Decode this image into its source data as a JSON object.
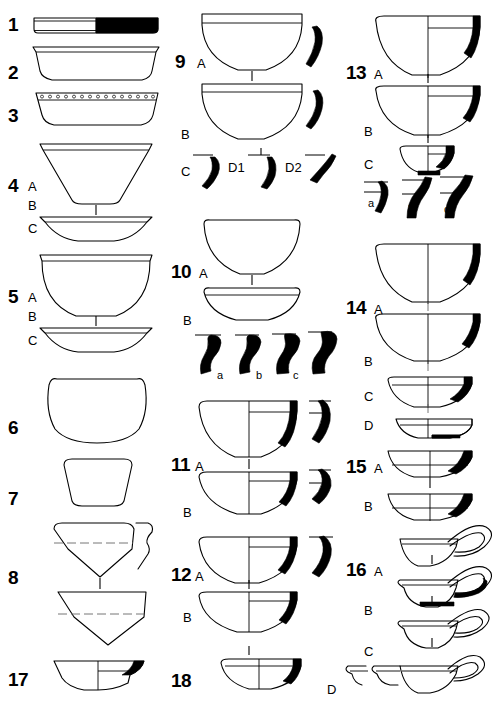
{
  "plate": {
    "title": "Pottery typology plate",
    "description": "Archaeological line-drawing plate of ceramic vessel profiles arranged in three columns, numbered 1 to 18 with lettered variants.",
    "background_color": "#ffffff",
    "ink_color": "#000000",
    "fill_color": "#000000"
  },
  "columns": [
    {
      "name": "column-left",
      "figures": [
        {
          "id": "fig-1",
          "number": "1",
          "variants": [],
          "form": "flat-disk",
          "note": "flat plate profile, right half solid black"
        },
        {
          "id": "fig-2",
          "number": "2",
          "variants": [],
          "form": "shallow-bowl",
          "note": "shallow open bowl with flat rim band"
        },
        {
          "id": "fig-3",
          "number": "3",
          "variants": [],
          "form": "shallow-bowl-dotted",
          "note": "shallow bowl with row of punctate dots below rim"
        },
        {
          "id": "fig-4",
          "number": "4",
          "variants": [
            "A",
            "B",
            "C"
          ],
          "form": "conical-bowl",
          "note": "deep conical bowl A over shallow bowl C"
        },
        {
          "id": "fig-5",
          "number": "5",
          "variants": [
            "A",
            "B",
            "C"
          ],
          "form": "hemispherical-bowl",
          "note": "hemispherical bowl A over shallow bowl C"
        },
        {
          "id": "fig-6",
          "number": "6",
          "variants": [],
          "form": "globular-jar",
          "note": "closed globular vessel"
        },
        {
          "id": "fig-7",
          "number": "7",
          "variants": [],
          "form": "small-cup",
          "note": "small straight-sided cup"
        },
        {
          "id": "fig-8",
          "number": "8",
          "variants": [],
          "form": "carinated-bowl",
          "note": "two carinated bowls with dashed carination line and rim sherd"
        },
        {
          "id": "fig-17",
          "number": "17",
          "variants": [],
          "form": "shallow-bowl-section",
          "note": "half-section bowl with black rim"
        }
      ]
    },
    {
      "name": "column-middle",
      "figures": [
        {
          "id": "fig-9",
          "number": "9",
          "variants": [
            "A",
            "B",
            "C",
            "D1",
            "D2"
          ],
          "form": "deep-bowl",
          "note": "two deep bowls with rim band plus three black rim sherds"
        },
        {
          "id": "fig-10",
          "number": "10",
          "variants": [
            "A",
            "B",
            "a",
            "b",
            "c"
          ],
          "form": "deep-bowl",
          "note": "deep bowl A, shallow bowl B, four black rim profiles a b c"
        },
        {
          "id": "fig-11",
          "number": "11",
          "variants": [
            "A",
            "B"
          ],
          "form": "half-section-bowl",
          "note": "half-section bowls with black rim wedge and separate sherds"
        },
        {
          "id": "fig-12",
          "number": "12",
          "variants": [
            "A",
            "B"
          ],
          "form": "half-section-bowl",
          "note": "half-section bowls with black rim wedge and separate sherds"
        },
        {
          "id": "fig-18",
          "number": "18",
          "variants": [],
          "form": "shallow-half-section",
          "note": "shallow half-section bowl with black rim"
        }
      ]
    },
    {
      "name": "column-right",
      "figures": [
        {
          "id": "fig-13",
          "number": "13",
          "variants": [
            "A",
            "B",
            "C",
            "a",
            "b",
            "c"
          ],
          "form": "half-section-bowl",
          "note": "three nested bowls plus three black rim sherds"
        },
        {
          "id": "fig-14",
          "number": "14",
          "variants": [
            "A",
            "B",
            "C",
            "D"
          ],
          "form": "half-section-bowl",
          "note": "four nested bowls of decreasing depth"
        },
        {
          "id": "fig-15",
          "number": "15",
          "variants": [
            "A",
            "B"
          ],
          "form": "shallow-half-section",
          "note": "two shallow half-section bowls"
        },
        {
          "id": "fig-16",
          "number": "16",
          "variants": [
            "A",
            "B",
            "C",
            "D"
          ],
          "form": "handled-lamp",
          "note": "four bowls with large loop handles; D row has two partial profiles"
        }
      ]
    }
  ],
  "labels": {
    "n1": "1",
    "n2": "2",
    "n3": "3",
    "n4": "4",
    "n5": "5",
    "n6": "6",
    "n7": "7",
    "n8": "8",
    "n9": "9",
    "n10": "10",
    "n11": "11",
    "n12": "12",
    "n13": "13",
    "n14": "14",
    "n15": "15",
    "n16": "16",
    "n17": "17",
    "n18": "18",
    "A": "A",
    "B": "B",
    "C": "C",
    "D": "D",
    "D1": "D1",
    "D2": "D2",
    "a": "a",
    "b": "b",
    "c": "c"
  }
}
